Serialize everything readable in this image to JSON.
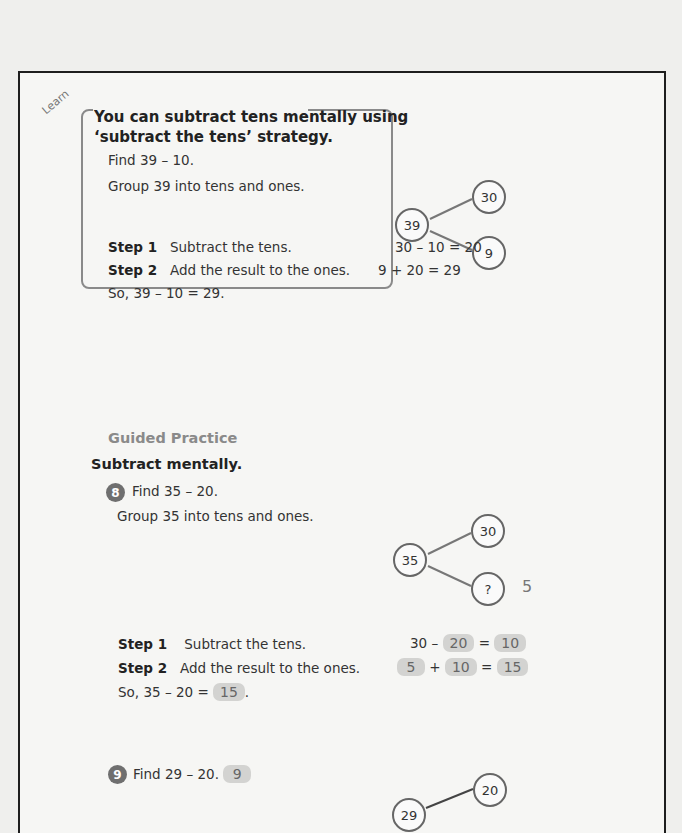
{
  "learn": {
    "tag": "Learn",
    "title_line1": "You can subtract tens mentally using",
    "title_line2": "‘subtract the tens’ strategy.",
    "find": "Find 39 – 10.",
    "group": "Group 39 into tens and ones.",
    "bond": {
      "whole": "39",
      "tens": "30",
      "ones": "9"
    },
    "step1_label": "Step 1",
    "step1_text": "Subtract the tens.",
    "step1_eq": "30 – 10 = 20",
    "step2_label": "Step 2",
    "step2_text": "Add the result to the ones.",
    "step2_eq": "9 + 20 = 29",
    "conclusion": "So, 39 – 10 = 29."
  },
  "guided": {
    "heading": "Guided Practice",
    "instruction": "Subtract mentally.",
    "q8": {
      "number": "8",
      "find": "Find 35 – 20.",
      "group": "Group 35 into tens and ones.",
      "bond": {
        "whole": "35",
        "tens": "30",
        "ones": "?",
        "ones_answer": "5"
      },
      "step1_label": "Step 1",
      "step1_text": "Subtract the tens.",
      "step1_eq_prefix": "30 –",
      "step1_answer_a": "20",
      "step1_eq_equals": "=",
      "step1_answer_b": "10",
      "step2_label": "Step 2",
      "step2_text": "Add the result to the ones.",
      "step2_answer_a": "5",
      "step2_plus": "+",
      "step2_answer_b": "10",
      "step2_equals": "=",
      "step2_answer_c": "15",
      "conclusion_prefix": "So, 35 – 20 =",
      "conclusion_answer": "15",
      "conclusion_suffix": "."
    },
    "q9": {
      "number": "9",
      "find": "Find 29 – 20.",
      "answer": "9",
      "bond": {
        "whole": "29",
        "tens": "20"
      }
    }
  }
}
